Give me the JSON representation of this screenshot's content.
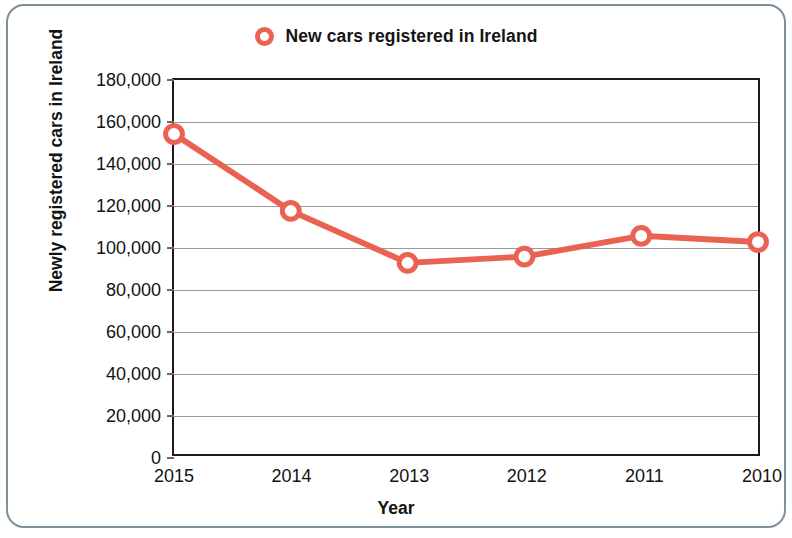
{
  "legend": {
    "marker_name": "circle-marker",
    "label": "New cars registered in Ireland",
    "color": "#ea6352"
  },
  "axes": {
    "y_title": "Newly registered cars in Ireland",
    "x_title": "Year"
  },
  "chart_data": {
    "type": "line",
    "title": "",
    "subtitle": "",
    "xlabel": "Year",
    "ylabel": "Newly registered cars in Ireland",
    "categories": [
      "2015",
      "2014",
      "2013",
      "2012",
      "2011",
      "2010"
    ],
    "values": [
      154000,
      117000,
      92000,
      95000,
      105000,
      102000
    ],
    "series": [
      {
        "name": "New cars registered in Ireland",
        "color": "#ea6352",
        "marker": "open-circle",
        "values": [
          154000,
          117000,
          92000,
          95000,
          105000,
          102000
        ]
      }
    ],
    "ylim": [
      0,
      180000
    ],
    "ytick_values": [
      0,
      20000,
      40000,
      60000,
      80000,
      100000,
      120000,
      140000,
      160000,
      180000
    ],
    "ytick_labels": [
      "0",
      "20,000",
      "40,000",
      "60,000",
      "80,000",
      "100,000",
      "120,000",
      "140,000",
      "160,000",
      "180,000"
    ],
    "xtick_labels": [
      "2015",
      "2014",
      "2013",
      "2012",
      "2011",
      "2010"
    ],
    "grid": "horizontal",
    "legend_position": "top-center"
  },
  "style": {
    "frame_color": "#1b1b1b",
    "grid_color": "#9a9a9a",
    "card_border_color": "#7d909b",
    "background": "#ffffff"
  }
}
